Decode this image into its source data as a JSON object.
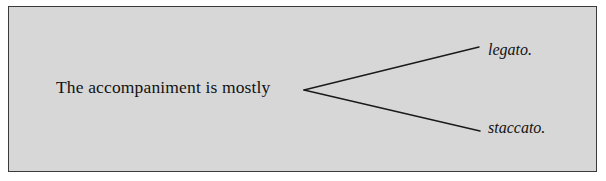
{
  "figure": {
    "type": "branching-sentence-diagram",
    "background_color": "#d7d7d7",
    "border_color": "#3a3a3a",
    "text_color": "#121212",
    "line_color": "#1a1a1a"
  },
  "stem": {
    "text": "The accompaniment is mostly"
  },
  "branches": [
    {
      "label": "legato.",
      "position": "upper"
    },
    {
      "label": "staccato.",
      "position": "lower"
    }
  ],
  "connector": {
    "vertex_x": 304,
    "vertex_y": 90,
    "upper_end_x": 479,
    "upper_end_y": 47,
    "lower_end_x": 480,
    "lower_end_y": 131
  }
}
